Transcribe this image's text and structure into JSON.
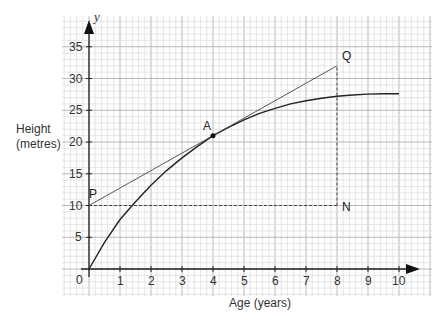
{
  "chart_data": {
    "type": "line",
    "title": "",
    "xlabel": "Age (years)",
    "ylabel": "Height (metres)",
    "ylabel_lines": [
      "Height",
      "(metres)"
    ],
    "y_axis_symbol": "y",
    "origin_label": "0",
    "xlim": [
      0,
      10
    ],
    "ylim": [
      0,
      35
    ],
    "x_ticks": [
      1,
      2,
      3,
      4,
      5,
      6,
      7,
      8,
      9,
      10
    ],
    "y_ticks": [
      5,
      10,
      15,
      20,
      25,
      30,
      35
    ],
    "grid": true,
    "series": [
      {
        "name": "growth curve",
        "style": "solid",
        "x": [
          0,
          0.5,
          1,
          1.5,
          2,
          2.5,
          3,
          3.5,
          4,
          4.5,
          5,
          5.5,
          6,
          6.5,
          7,
          7.5,
          8,
          8.5,
          9,
          9.5,
          10
        ],
        "y": [
          0,
          4.2,
          7.8,
          10.6,
          13.2,
          15.5,
          17.5,
          19.3,
          21,
          22.3,
          23.5,
          24.5,
          25.3,
          26,
          26.5,
          26.9,
          27.2,
          27.4,
          27.55,
          27.6,
          27.6
        ]
      },
      {
        "name": "tangent PQ",
        "style": "thin",
        "x": [
          0,
          8
        ],
        "y": [
          10,
          32
        ]
      },
      {
        "name": "PN",
        "style": "dashed",
        "x": [
          0,
          8
        ],
        "y": [
          10,
          10
        ]
      },
      {
        "name": "NQ",
        "style": "dashed",
        "x": [
          8,
          8
        ],
        "y": [
          10,
          32
        ]
      }
    ],
    "annotations": [
      {
        "label": "A",
        "x": 4,
        "y": 21,
        "marker": true
      },
      {
        "label": "P",
        "x": 0,
        "y": 10
      },
      {
        "label": "Q",
        "x": 8,
        "y": 32
      },
      {
        "label": "N",
        "x": 8,
        "y": 10
      }
    ]
  }
}
